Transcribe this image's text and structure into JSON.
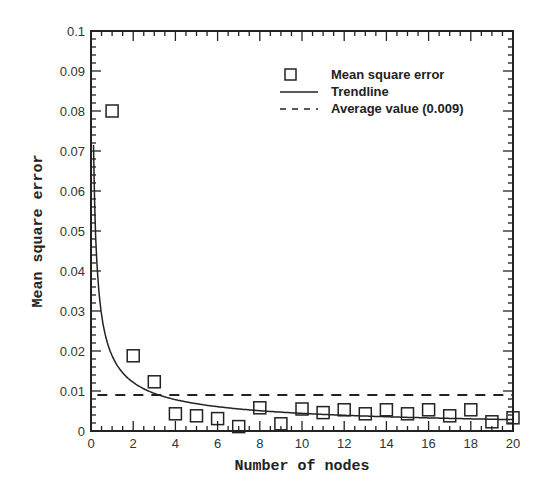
{
  "chart_data": {
    "type": "scatter",
    "title": "",
    "xlabel": "Number of nodes",
    "ylabel": "Mean square error",
    "xlim": [
      0,
      20
    ],
    "ylim": [
      0,
      0.1
    ],
    "x_ticks": [
      0,
      2,
      4,
      6,
      8,
      10,
      12,
      14,
      16,
      18,
      20
    ],
    "x_tick_labels": [
      "0",
      "2",
      "4",
      "6",
      "8",
      "10",
      "12",
      "14",
      "16",
      "18",
      "20"
    ],
    "y_ticks": [
      0,
      0.01,
      0.02,
      0.03,
      0.04,
      0.05,
      0.06,
      0.07,
      0.08,
      0.09,
      0.1
    ],
    "y_tick_labels": [
      "0",
      "0.01",
      "0.02",
      "0.03",
      "0.04",
      "0.05",
      "0.06",
      "0.07",
      "0.08",
      "0.09",
      "0.1"
    ],
    "grid": false,
    "legend_position": "upper right",
    "series": [
      {
        "name": "Mean square error",
        "style": "open-square-markers",
        "x": [
          1,
          2,
          3,
          4,
          5,
          6,
          7,
          8,
          9,
          10,
          11,
          12,
          13,
          14,
          15,
          16,
          17,
          18,
          19,
          20
        ],
        "values": [
          0.08,
          0.0188,
          0.0123,
          0.0043,
          0.0038,
          0.0031,
          0.0011,
          0.0058,
          0.0018,
          0.0055,
          0.0046,
          0.0053,
          0.0043,
          0.0053,
          0.0043,
          0.0053,
          0.0038,
          0.0053,
          0.0023,
          0.0033
        ]
      },
      {
        "name": "Trendline",
        "style": "solid-line",
        "description": "power-law decay from ~0.075 near x=0.1 to ~0.003 at x=20"
      },
      {
        "name": "Average value (0.009)",
        "style": "dashed-line",
        "value": 0.009
      }
    ]
  },
  "legend": {
    "items": [
      {
        "label": "Mean square error",
        "marker": "square"
      },
      {
        "label": "Trendline",
        "marker": "solid"
      },
      {
        "label": "Average value (0.009)",
        "marker": "dashed"
      }
    ]
  },
  "colors": {
    "ink": "#222222",
    "background": "#ffffff"
  }
}
